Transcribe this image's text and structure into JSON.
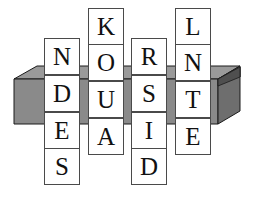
{
  "scene": {
    "title": "Crossword letter tiles resting in an open box",
    "background_color": "#ffffff"
  },
  "box": {
    "name": "open tray box",
    "front_face_color": "#8a8a8a",
    "right_face_color": "#6e6e6e",
    "rim_top_color": "#9a9a9a",
    "interior_color": "#5a5a5a",
    "outline_color": "#1a1a1a"
  },
  "puzzle": {
    "horizontal_word": "DUST",
    "columns": [
      {
        "id": "col-1",
        "word": "NDES",
        "letters": [
          "N",
          "D",
          "E",
          "S"
        ],
        "box_row_index": 1
      },
      {
        "id": "col-2",
        "word": "KOUA",
        "letters": [
          "K",
          "O",
          "U",
          "A"
        ],
        "box_row_index": 2
      },
      {
        "id": "col-3",
        "word": "RSID",
        "letters": [
          "R",
          "S",
          "I",
          "D"
        ],
        "box_row_index": 1
      },
      {
        "id": "col-4",
        "word": "LNTE",
        "letters": [
          "L",
          "N",
          "T",
          "E"
        ],
        "box_row_index": 2
      }
    ]
  },
  "tiles": [
    {
      "letter": "N",
      "x": 44,
      "y": 38,
      "layer": "above"
    },
    {
      "letter": "D",
      "x": 44,
      "y": 75,
      "layer": "inbox"
    },
    {
      "letter": "E",
      "x": 44,
      "y": 112,
      "layer": "below"
    },
    {
      "letter": "S",
      "x": 44,
      "y": 148,
      "layer": "below"
    },
    {
      "letter": "K",
      "x": 88,
      "y": 8,
      "layer": "above"
    },
    {
      "letter": "O",
      "x": 88,
      "y": 44,
      "layer": "above"
    },
    {
      "letter": "U",
      "x": 88,
      "y": 81,
      "layer": "inbox"
    },
    {
      "letter": "A",
      "x": 88,
      "y": 118,
      "layer": "below"
    },
    {
      "letter": "R",
      "x": 131,
      "y": 38,
      "layer": "above"
    },
    {
      "letter": "S",
      "x": 131,
      "y": 75,
      "layer": "inbox"
    },
    {
      "letter": "I",
      "x": 131,
      "y": 112,
      "layer": "below"
    },
    {
      "letter": "D",
      "x": 131,
      "y": 148,
      "layer": "below"
    },
    {
      "letter": "L",
      "x": 175,
      "y": 8,
      "layer": "above"
    },
    {
      "letter": "N",
      "x": 175,
      "y": 44,
      "layer": "above"
    },
    {
      "letter": "T",
      "x": 175,
      "y": 81,
      "layer": "inbox"
    },
    {
      "letter": "E",
      "x": 175,
      "y": 118,
      "layer": "below"
    }
  ]
}
